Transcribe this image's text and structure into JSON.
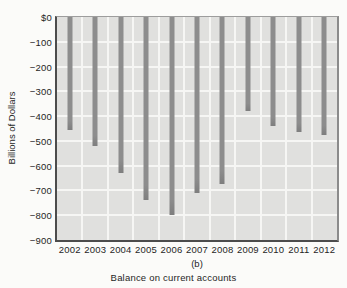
{
  "chart_data": {
    "type": "bar",
    "caption_label": "(b)",
    "caption_title": "Balance on current accounts",
    "ylabel": "Billions of Dollars",
    "categories": [
      "2002",
      "2003",
      "2004",
      "2005",
      "2006",
      "2007",
      "2008",
      "2009",
      "2010",
      "2011",
      "2012"
    ],
    "values": [
      -455,
      -520,
      -630,
      -740,
      -800,
      -710,
      -675,
      -380,
      -440,
      -465,
      -475
    ],
    "ylim": [
      -900,
      0
    ],
    "ytick_labels": [
      "$0",
      "−100",
      "−200",
      "−300",
      "−400",
      "−500",
      "−600",
      "−700",
      "−800",
      "−900"
    ],
    "grid": true,
    "legend": "none",
    "colors": {
      "bar": "#8d8d8d",
      "bar_tip": "#7e7e7e",
      "plot_background": "#e0e0de",
      "gridline": "#f6f6f4",
      "axis": "#4c4c4c",
      "text": "#1f1f1f"
    }
  }
}
